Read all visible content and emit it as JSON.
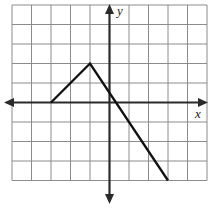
{
  "figure": {
    "title": "",
    "background_color": "#ffffff"
  },
  "axes": {
    "x_label": "x",
    "y_label": "y",
    "axis_color": "#2b2b2b",
    "grid_color": "#8c8c8c",
    "x_axis_arrow_left": true,
    "x_axis_arrow_right": true,
    "y_axis_arrow_up": true,
    "y_axis_arrow_down": true
  },
  "chart_data": {
    "type": "line",
    "title": "",
    "xlabel": "x",
    "ylabel": "y",
    "grid": true,
    "legend": "none",
    "xlim": [
      -5,
      5
    ],
    "ylim": [
      -5,
      4
    ],
    "xticks": [
      -5,
      -4,
      -3,
      -2,
      -1,
      0,
      1,
      2,
      3,
      4,
      5
    ],
    "yticks": [
      -5,
      -4,
      -3,
      -2,
      -1,
      0,
      1,
      2,
      3,
      4
    ],
    "tick_labels_visible": false,
    "series": [
      {
        "name": "piecewise-path",
        "color": "#111111",
        "line_width": 2,
        "x": [
          -3,
          -1,
          3
        ],
        "y": [
          0,
          2,
          -4
        ]
      }
    ],
    "annotations": [
      {
        "name": "left-endpoint",
        "x": -3,
        "y": 0
      },
      {
        "name": "peak-vertex",
        "x": -1,
        "y": 2
      },
      {
        "name": "right-endpoint",
        "x": 3,
        "y": -4
      }
    ]
  },
  "geometry": {
    "grid_origin_px": {
      "x": 12,
      "y": 5
    },
    "cell_size_px": 19.5,
    "columns": 10,
    "rows": 9,
    "x_axis_y_px": 102.5,
    "y_axis_x_px": 109.5
  }
}
